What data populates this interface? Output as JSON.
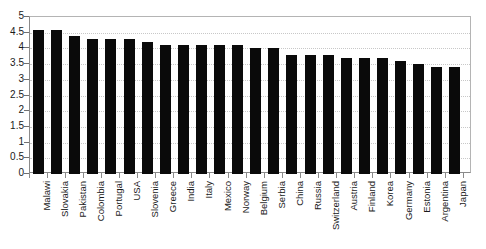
{
  "chart_data": {
    "type": "bar",
    "title": "",
    "xlabel": "",
    "ylabel": "",
    "ylim": [
      0,
      5
    ],
    "ytick_labels": [
      "5",
      "4.5",
      "4",
      "3.5",
      "3",
      "2.5",
      "2",
      "1.5",
      "1",
      "0.5",
      "0"
    ],
    "ytick_values": [
      5,
      4.5,
      4,
      3.5,
      3,
      2.5,
      2,
      1.5,
      1,
      0.5,
      0
    ],
    "grid": true,
    "legend": "none",
    "bar_color": "#0a0a0a",
    "categories": [
      "Malawi",
      "Slovakia",
      "Pakistan",
      "Colombia",
      "Portugal",
      "USA",
      "Slovenia",
      "Greece",
      "India",
      "Italy",
      "Mexico",
      "Norway",
      "Belgium",
      "Serbia",
      "China",
      "Russia",
      "Switzerland",
      "Austria",
      "Finland",
      "Korea",
      "Germany",
      "Estonia",
      "Argentina",
      "Japan"
    ],
    "values": [
      4.6,
      4.6,
      4.4,
      4.3,
      4.3,
      4.3,
      4.2,
      4.1,
      4.1,
      4.1,
      4.1,
      4.1,
      4.0,
      4.0,
      3.8,
      3.8,
      3.8,
      3.7,
      3.7,
      3.7,
      3.6,
      3.5,
      3.4,
      3.4
    ]
  }
}
